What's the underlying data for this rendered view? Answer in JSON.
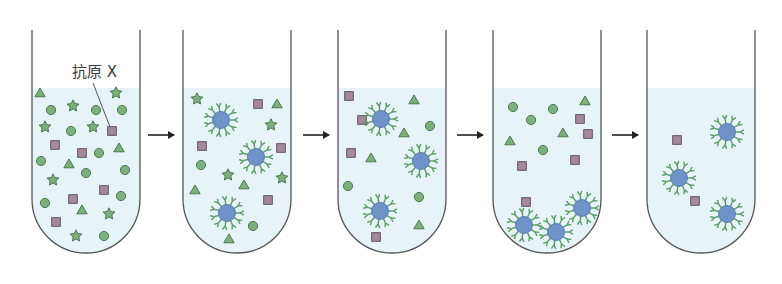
{
  "diagram": {
    "label": {
      "text": "抗原 X",
      "x": 72,
      "y": 77,
      "pointer_from": [
        93,
        83
      ],
      "pointer_to": [
        110,
        127
      ]
    },
    "colors": {
      "liquid": "#e6f4f7",
      "tube_outline": "#555555",
      "green_fill": "#7db07d",
      "green_stroke": "#3f6e44",
      "square_fill": "#a48a99",
      "square_stroke": "#5a4652",
      "bead_fill": "#6f93c8",
      "bead_stroke": "#4c6ea6",
      "antibody": "#5a9a63",
      "arrow": "#222222"
    },
    "tube_geometry": {
      "width": 108,
      "top": 30,
      "liquid_top": 88,
      "bottom": 253
    },
    "arrows": [
      {
        "x1": 148,
        "x2": 174,
        "y": 135
      },
      {
        "x1": 303,
        "x2": 329,
        "y": 135
      },
      {
        "x1": 457,
        "x2": 483,
        "y": 135
      },
      {
        "x1": 612,
        "x2": 638,
        "y": 135
      }
    ],
    "tubes": [
      {
        "id": "tube-1-initial-mixture",
        "x": 32,
        "triangles": [
          [
            40,
            93
          ],
          [
            119,
            148
          ],
          [
            69,
            164
          ],
          [
            82,
            210
          ]
        ],
        "stars": [
          [
            116,
            93
          ],
          [
            73,
            106
          ],
          [
            45,
            127
          ],
          [
            93,
            127
          ],
          [
            53,
            180
          ],
          [
            109,
            214
          ],
          [
            76,
            236
          ]
        ],
        "circles": [
          [
            51,
            110
          ],
          [
            96,
            110
          ],
          [
            122,
            110
          ],
          [
            71,
            131
          ],
          [
            99,
            153
          ],
          [
            41,
            161
          ],
          [
            86,
            173
          ],
          [
            125,
            170
          ],
          [
            45,
            203
          ],
          [
            121,
            196
          ],
          [
            104,
            236
          ]
        ],
        "squares": [
          [
            112,
            131
          ],
          [
            55,
            145
          ],
          [
            82,
            153
          ],
          [
            104,
            190
          ],
          [
            73,
            199
          ],
          [
            56,
            222
          ]
        ],
        "beads": []
      },
      {
        "id": "tube-2-beads-added",
        "x": 183,
        "triangles": [
          [
            277,
            104
          ],
          [
            195,
            190
          ],
          [
            244,
            185
          ],
          [
            229,
            239
          ]
        ],
        "stars": [
          [
            197,
            99
          ],
          [
            271,
            125
          ],
          [
            228,
            175
          ],
          [
            282,
            178
          ]
        ],
        "circles": [
          [
            201,
            165
          ],
          [
            253,
            226
          ]
        ],
        "squares": [
          [
            258,
            104
          ],
          [
            202,
            146
          ],
          [
            281,
            148
          ],
          [
            268,
            200
          ]
        ],
        "beads": [
          [
            221,
            120
          ],
          [
            256,
            157
          ],
          [
            227,
            213
          ]
        ]
      },
      {
        "id": "tube-3-antigen-bound",
        "x": 338,
        "triangles": [
          [
            414,
            100
          ],
          [
            404,
            133
          ],
          [
            371,
            158
          ],
          [
            419,
            225
          ]
        ],
        "stars": [],
        "circles": [
          [
            430,
            126
          ],
          [
            348,
            186
          ],
          [
            419,
            197
          ]
        ],
        "squares": [
          [
            349,
            96
          ],
          [
            362,
            120
          ],
          [
            351,
            153
          ],
          [
            376,
            237
          ]
        ],
        "beads": [
          [
            381,
            119
          ],
          [
            421,
            161
          ],
          [
            380,
            211
          ]
        ]
      },
      {
        "id": "tube-4-beads-pelleted",
        "x": 493,
        "triangles": [
          [
            585,
            101
          ],
          [
            510,
            141
          ],
          [
            563,
            133
          ]
        ],
        "stars": [],
        "circles": [
          [
            513,
            107
          ],
          [
            553,
            109
          ],
          [
            531,
            120
          ],
          [
            543,
            150
          ]
        ],
        "squares": [
          [
            580,
            119
          ],
          [
            588,
            134
          ],
          [
            575,
            160
          ],
          [
            522,
            166
          ],
          [
            526,
            202
          ]
        ],
        "beads": [
          [
            524,
            225
          ],
          [
            556,
            232
          ],
          [
            582,
            208
          ]
        ]
      },
      {
        "id": "tube-5-washed-purified",
        "x": 647,
        "triangles": [],
        "stars": [],
        "circles": [],
        "squares": [
          [
            677,
            140
          ],
          [
            695,
            201
          ]
        ],
        "beads": [
          [
            727,
            132
          ],
          [
            679,
            178
          ],
          [
            727,
            214
          ]
        ]
      }
    ]
  }
}
